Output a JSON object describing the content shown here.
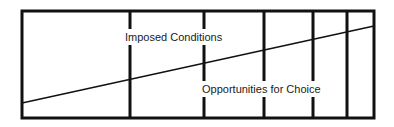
{
  "diagram": {
    "type": "spectrum-diagram",
    "frame": {
      "x": 22,
      "y": 11,
      "width": 352,
      "height": 107,
      "stroke": "#111111",
      "stroke_width": 3
    },
    "dividers": [
      130,
      204,
      264,
      313,
      347
    ],
    "diagonal": {
      "x1": 22,
      "y1": 103,
      "x2": 374,
      "y2": 26,
      "stroke_width": 1.5
    },
    "labels": {
      "top": {
        "text": "Imposed Conditions",
        "x": 125,
        "y": 41
      },
      "bottom": {
        "text": "Opportunities for Choice",
        "x": 202,
        "y": 93
      }
    },
    "colors": {
      "line": "#111111",
      "background": "#ffffff",
      "text": "#1a1a1a"
    }
  }
}
